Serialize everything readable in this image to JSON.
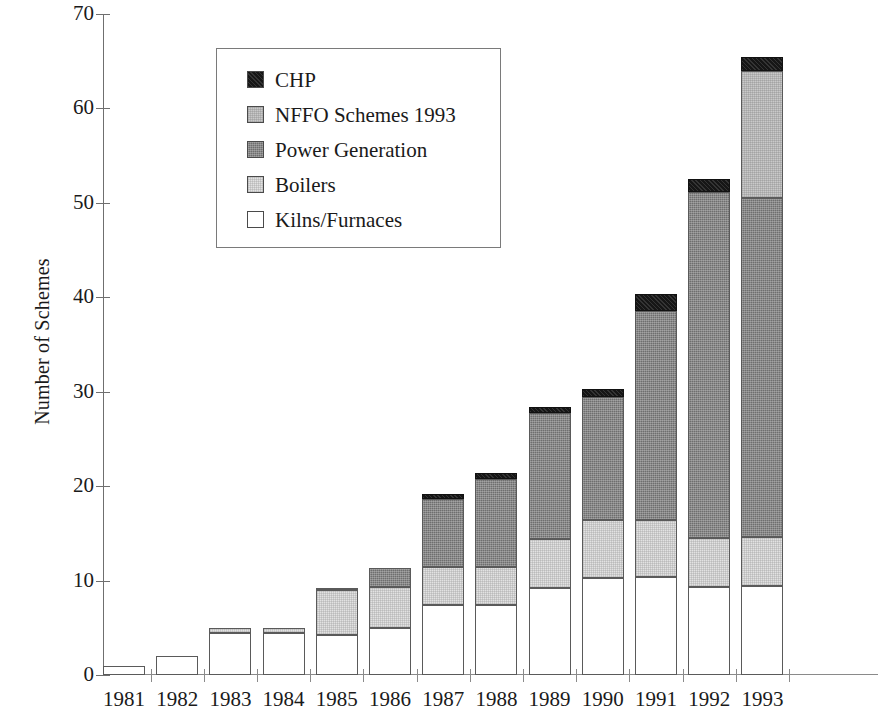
{
  "chart_data": {
    "type": "bar",
    "subtype": "stacked-bar",
    "title": "",
    "xlabel": "",
    "ylabel": "Number of Schemes",
    "ylim": [
      0,
      70
    ],
    "yticks": [
      0,
      10,
      20,
      30,
      40,
      50,
      60,
      70
    ],
    "ytick_labels": [
      "0",
      "10",
      "20",
      "30",
      "40",
      "50",
      "60",
      "70"
    ],
    "grid": false,
    "legend_position": "upper-left-inside",
    "categories": [
      "1981",
      "1982",
      "1983",
      "1984",
      "1985",
      "1986",
      "1987",
      "1988",
      "1989",
      "1990",
      "1991",
      "1992",
      "1993"
    ],
    "series": [
      {
        "name": "Kilns/Furnaces",
        "color": "#ffffff",
        "values": [
          1,
          2,
          4.5,
          4.5,
          4.2,
          5.0,
          7.4,
          7.4,
          9.2,
          10.3,
          10.4,
          9.3,
          9.4
        ]
      },
      {
        "name": "Boilers",
        "color": "#e2e2e2",
        "values": [
          0,
          0,
          0.5,
          0.5,
          4.8,
          4.3,
          4.0,
          4.0,
          5.2,
          6.1,
          6.0,
          5.2,
          5.2
        ]
      },
      {
        "name": "Power Generation",
        "color": "#6e6e6e",
        "values": [
          0,
          0,
          0,
          0,
          0.2,
          2.0,
          7.2,
          9.4,
          13.4,
          13.0,
          22.2,
          36.7,
          35.9
        ]
      },
      {
        "name": "NFFO Schemes 1993",
        "color": "#c9c9c9",
        "values": [
          0,
          0,
          0,
          0,
          0,
          0,
          0,
          0,
          0,
          0,
          0,
          0,
          13.5
        ]
      },
      {
        "name": "CHP",
        "color": "#161616",
        "values": [
          0,
          0,
          0,
          0,
          0,
          0,
          0.6,
          0.6,
          0.6,
          0.9,
          1.8,
          1.3,
          1.4
        ]
      }
    ],
    "totals": [
      1,
      2,
      5,
      5,
      9.2,
      11.3,
      19.2,
      21.4,
      28.4,
      30.3,
      40.4,
      52.5,
      65.4
    ],
    "stack_order_bottom_to_top": [
      "Kilns/Furnaces",
      "Boilers",
      "Power Generation",
      "NFFO Schemes 1993",
      "CHP"
    ]
  },
  "legend": {
    "items": [
      {
        "label": "CHP",
        "swatch": "chp"
      },
      {
        "label": "NFFO Schemes 1993",
        "swatch": "nffo"
      },
      {
        "label": "Power Generation",
        "swatch": "power"
      },
      {
        "label": "Boilers",
        "swatch": "boilers"
      },
      {
        "label": "Kilns/Furnaces",
        "swatch": "kilns"
      }
    ]
  }
}
